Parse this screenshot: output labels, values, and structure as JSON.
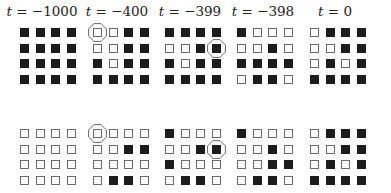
{
  "figure": {
    "columns": [
      {
        "label_var": "t",
        "label_eq": " = ",
        "label_val": "−1000",
        "center_x": 42
      },
      {
        "label_var": "t",
        "label_eq": " = ",
        "label_val": "−400",
        "center_x": 117
      },
      {
        "label_var": "t",
        "label_eq": " = ",
        "label_val": "−399",
        "center_x": 190
      },
      {
        "label_var": "t",
        "label_eq": " = ",
        "label_val": "−398",
        "center_x": 263
      },
      {
        "label_var": "t",
        "label_eq": " = ",
        "label_val": "0",
        "center_x": 335
      }
    ],
    "grid_x": [
      20,
      93,
      165,
      237,
      310
    ],
    "row_y": [
      28,
      129
    ],
    "cell_pitch": 15.5,
    "colors": {
      "filled": "#1c1c1c",
      "empty_border": "#6a6a6a",
      "marker": "#555555"
    },
    "rows": [
      {
        "name": "top",
        "grids": [
          {
            "cells": [
              [
                1,
                1,
                1,
                1
              ],
              [
                1,
                1,
                1,
                1
              ],
              [
                1,
                1,
                1,
                1
              ],
              [
                1,
                1,
                1,
                1
              ]
            ],
            "highlight": null
          },
          {
            "cells": [
              [
                0,
                0,
                1,
                1
              ],
              [
                0,
                0,
                1,
                1
              ],
              [
                1,
                0,
                1,
                1
              ],
              [
                1,
                1,
                1,
                1
              ]
            ],
            "highlight": [
              0,
              0
            ]
          },
          {
            "cells": [
              [
                1,
                1,
                1,
                1
              ],
              [
                0,
                0,
                1,
                1
              ],
              [
                1,
                0,
                1,
                1
              ],
              [
                1,
                1,
                1,
                1
              ]
            ],
            "highlight": [
              1,
              3
            ]
          },
          {
            "cells": [
              [
                1,
                0,
                0,
                0
              ],
              [
                0,
                0,
                1,
                0
              ],
              [
                1,
                1,
                1,
                1
              ],
              [
                0,
                1,
                1,
                0
              ]
            ],
            "highlight": null
          },
          {
            "cells": [
              [
                0,
                1,
                1,
                1
              ],
              [
                0,
                0,
                1,
                1
              ],
              [
                0,
                1,
                0,
                1
              ],
              [
                1,
                1,
                1,
                1
              ]
            ],
            "highlight": null
          }
        ]
      },
      {
        "name": "bottom",
        "grids": [
          {
            "cells": [
              [
                0,
                0,
                0,
                0
              ],
              [
                0,
                0,
                0,
                0
              ],
              [
                0,
                0,
                0,
                0
              ],
              [
                0,
                0,
                0,
                0
              ]
            ],
            "highlight": null
          },
          {
            "cells": [
              [
                0,
                0,
                0,
                0
              ],
              [
                0,
                0,
                1,
                1
              ],
              [
                0,
                0,
                0,
                0
              ],
              [
                0,
                1,
                1,
                0
              ]
            ],
            "highlight": [
              0,
              0
            ]
          },
          {
            "cells": [
              [
                1,
                0,
                0,
                0
              ],
              [
                0,
                0,
                1,
                1
              ],
              [
                1,
                0,
                0,
                0
              ],
              [
                0,
                1,
                1,
                0
              ]
            ],
            "highlight": [
              1,
              3
            ]
          },
          {
            "cells": [
              [
                1,
                0,
                0,
                0
              ],
              [
                0,
                0,
                1,
                0
              ],
              [
                0,
                0,
                1,
                1
              ],
              [
                0,
                1,
                1,
                0
              ]
            ],
            "highlight": null
          },
          {
            "cells": [
              [
                0,
                1,
                1,
                1
              ],
              [
                0,
                0,
                1,
                1
              ],
              [
                0,
                1,
                0,
                1
              ],
              [
                1,
                1,
                1,
                1
              ]
            ],
            "highlight": null
          }
        ]
      }
    ]
  }
}
